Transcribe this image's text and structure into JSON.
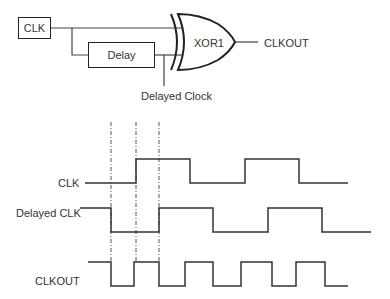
{
  "circuit": {
    "clk_box_label": "CLK",
    "delay_box_label": "Delay",
    "gate_label": "XOR1",
    "output_label": "CLKOUT",
    "tap_label": "Delayed Clock"
  },
  "timing": {
    "signals": [
      {
        "name": "CLK",
        "label_x": 60,
        "high_y": 159,
        "low_y": 183,
        "start_x": 85,
        "start_level": "low",
        "edges": [
          136,
          190,
          245,
          299
        ],
        "end_x": 348
      },
      {
        "name": "Delayed CLK",
        "label_x": 16,
        "high_y": 208,
        "low_y": 232,
        "start_x": 80,
        "start_level": "high",
        "edges": [
          111,
          159,
          213,
          268,
          322
        ],
        "end_x": 371
      },
      {
        "name": "CLKOUT",
        "label_x": 35,
        "high_y": 262,
        "low_y": 286,
        "start_x": 88,
        "start_level": "high",
        "edges": [
          111,
          134,
          159,
          185,
          213,
          241,
          272,
          296,
          325
        ],
        "end_x": 348
      }
    ],
    "markers_x": [
      111,
      136,
      159
    ],
    "marker_top_y": 122,
    "marker_bottom_y": 262
  },
  "colors": {
    "line": "#222222",
    "text": "#333333",
    "background": "#ffffff"
  }
}
